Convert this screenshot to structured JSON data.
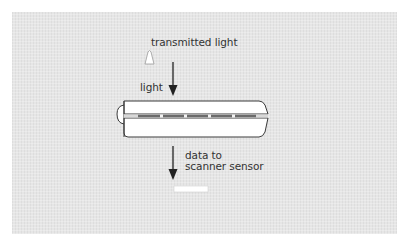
{
  "diagram": {
    "labels": {
      "transmitted_light": "transmitted light",
      "light": "light",
      "data_to": "data to",
      "scanner_sensor": "scanner sensor"
    },
    "components": {
      "light_source": "light-bulb",
      "film_holder": "film-strip-holder",
      "sensor": "scanner-sensor"
    },
    "colors": {
      "background": "#e6e6e6",
      "outline": "#3a3a3a",
      "body_fill": "#ffffff",
      "stripe_dark": "#6b6b6b",
      "stripe_light": "#f2f2f2",
      "text": "#333333"
    }
  }
}
